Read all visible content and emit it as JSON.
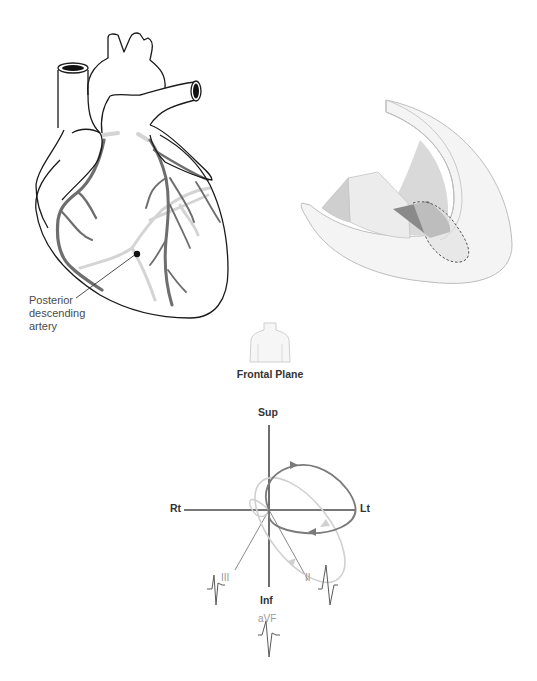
{
  "figure": {
    "heart": {
      "annotation": {
        "line1": "Posterior",
        "line2": "descending",
        "line3": "artery"
      }
    },
    "ventricle_section": {
      "description": "cutaway wedge of left ventricle with shaded infarct region (dashed outline)"
    },
    "frontal_plane": {
      "title": "Frontal Plane",
      "axes": {
        "superior": "Sup",
        "inferior": "Inf",
        "right": "Rt",
        "left": "Lt"
      },
      "leads": {
        "lead_iii": "III",
        "lead_ii": "II",
        "lead_avf": "aVF"
      }
    }
  },
  "colors": {
    "outline": "#1a1a1a",
    "artery_dark": "#6e6e6e",
    "artery_light": "#d2d2d2",
    "loop_normal": "#7a7a7a",
    "loop_abnormal": "#cfcfcf",
    "axis": "#555555",
    "infarct": "#8a8a8a"
  }
}
